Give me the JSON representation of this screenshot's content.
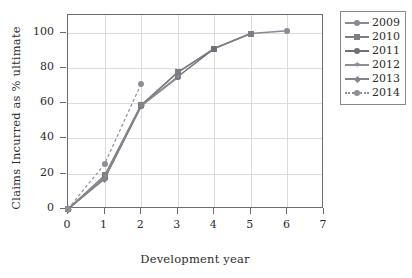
{
  "chart_data": {
    "type": "line",
    "title": "",
    "xlabel": "Development year",
    "ylabel": "Claims Incurred as % ultimate",
    "xlim": [
      0,
      7
    ],
    "ylim": [
      0,
      110
    ],
    "xticks": [
      0,
      1,
      2,
      3,
      4,
      5,
      6,
      7
    ],
    "yticks": [
      0,
      20,
      40,
      60,
      80,
      100
    ],
    "grid": true,
    "legend_position": "right-outside",
    "series": [
      {
        "name": "2009",
        "marker": "circle",
        "linestyle": "solid",
        "color": "#8a8a92",
        "x": [
          0,
          1,
          2,
          3,
          4,
          5,
          6
        ],
        "values": [
          0,
          17.5,
          58.5,
          77.5,
          91,
          99.5,
          101
        ]
      },
      {
        "name": "2010",
        "marker": "square",
        "linestyle": "solid",
        "color": "#7d7d86",
        "x": [
          0,
          1,
          2,
          3,
          4,
          5
        ],
        "values": [
          0,
          19,
          59,
          77.5,
          91,
          99.5
        ]
      },
      {
        "name": "2011",
        "marker": "circle",
        "linestyle": "solid",
        "color": "#6f6f78",
        "x": [
          0,
          1,
          2,
          3,
          4
        ],
        "values": [
          0,
          17.5,
          58.5,
          75,
          91
        ]
      },
      {
        "name": "2012",
        "marker": "star",
        "linestyle": "solid",
        "color": "#8d8d95",
        "x": [
          0,
          1,
          2,
          3
        ],
        "values": [
          0,
          18,
          58.5,
          74.5
        ]
      },
      {
        "name": "2013",
        "marker": "diamond",
        "linestyle": "solid",
        "color": "#83838c",
        "x": [
          0,
          1,
          2
        ],
        "values": [
          0,
          17,
          58.5
        ]
      },
      {
        "name": "2014",
        "marker": "circle",
        "linestyle": "dashed",
        "color": "#8e8e98",
        "x": [
          0,
          1,
          2
        ],
        "values": [
          0,
          25.5,
          71
        ]
      }
    ]
  },
  "axes": {
    "x_label": "Development year",
    "y_label": "Claims Incurred as % ultimate",
    "x_ticklabels": [
      "0",
      "1",
      "2",
      "3",
      "4",
      "5",
      "6",
      "7"
    ],
    "y_ticklabels": [
      "0",
      "20",
      "40",
      "60",
      "80",
      "100"
    ]
  },
  "legend": {
    "entries": [
      {
        "label": "2009",
        "marker": "circle",
        "linestyle": "solid"
      },
      {
        "label": "2010",
        "marker": "square",
        "linestyle": "solid"
      },
      {
        "label": "2011",
        "marker": "circle",
        "linestyle": "solid"
      },
      {
        "label": "2012",
        "marker": "star",
        "linestyle": "solid"
      },
      {
        "label": "2013",
        "marker": "diamond",
        "linestyle": "solid"
      },
      {
        "label": "2014",
        "marker": "circle",
        "linestyle": "dashed"
      }
    ]
  },
  "colors": {
    "frame": "#6d6d6d",
    "grid": "#dcdcdc",
    "text": "#2b2b2b",
    "background": "#ffffff"
  }
}
